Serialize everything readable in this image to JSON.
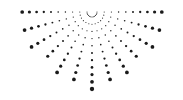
{
  "graphic": {
    "name": "dotted-half-sunburst",
    "dot_color": "#1a1a1a",
    "background": "#ffffff",
    "center": [
      92,
      12
    ],
    "ray_angles_deg": [
      0,
      15,
      30,
      45,
      60,
      75,
      90,
      105,
      120,
      135,
      150,
      165,
      180
    ],
    "ray_lengths": [
      75,
      72,
      70,
      64,
      74,
      70,
      78,
      70,
      74,
      64,
      70,
      72,
      75
    ],
    "inner_radius": 5,
    "step": 7.2,
    "min_dot_radius": 0.5,
    "max_dot_radius": 2.2
  }
}
